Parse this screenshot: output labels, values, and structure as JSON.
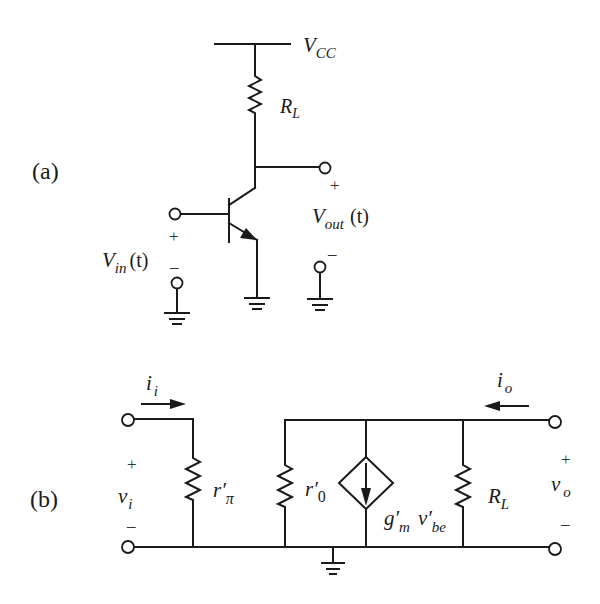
{
  "figure": {
    "panel_a": {
      "tag": "(a)",
      "supply_label": "V",
      "supply_sub": "CC",
      "load_label": "R",
      "load_sub": "L",
      "vin_label": "V",
      "vin_sub": "in",
      "vin_arg": "(t)",
      "vout_label": "V",
      "vout_sub": "out",
      "vout_arg": "(t)",
      "plus": "+",
      "minus": "–"
    },
    "panel_b": {
      "tag": "(b)",
      "ii_label": "i",
      "ii_sub": "i",
      "io_label": "i",
      "io_sub": "o",
      "vi_label": "v",
      "vi_sub": "i",
      "vo_label": "v",
      "vo_sub": "o",
      "rpi_label": "r′",
      "rpi_sub": "π",
      "r0_label": "r′",
      "r0_sub": "0",
      "gm_label": "g′",
      "gm_sub": "m",
      "vbe_label": "v′",
      "vbe_sub": "be",
      "rl_label": "R",
      "rl_sub": "L",
      "plus": "+",
      "minus": "–"
    }
  }
}
